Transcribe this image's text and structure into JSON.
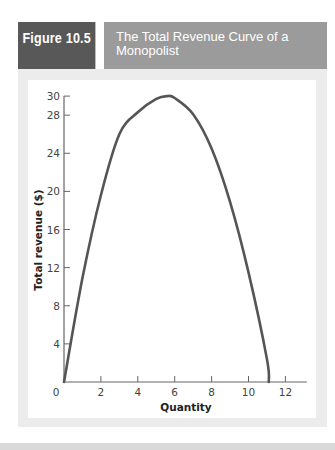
{
  "header": {
    "figure_label": "Figure 10.5",
    "title_line1": "The Total Revenue Curve of a",
    "title_line2": "Monopolist",
    "colors": {
      "label_bg": "#585858",
      "title_bg": "#9b9b9b",
      "text": "#ffffff"
    }
  },
  "chart_data": {
    "type": "line",
    "title": "The Total Revenue Curve of a Monopolist",
    "xlabel": "Quantity",
    "ylabel": "Total revenue ($)",
    "xlim": [
      0,
      13
    ],
    "ylim": [
      0,
      30
    ],
    "xticks": [
      0,
      2,
      4,
      6,
      8,
      10,
      12
    ],
    "yticks": [
      4,
      8,
      12,
      16,
      20,
      24,
      28,
      30
    ],
    "grid": false,
    "legend": null,
    "line_color": "#555555",
    "series": [
      {
        "name": "Total revenue",
        "x": [
          0,
          1,
          2,
          3,
          4,
          5,
          5.6,
          6,
          7,
          8,
          9,
          10,
          11,
          11.1
        ],
        "y": [
          0,
          10.9,
          19.6,
          26.0,
          28.3,
          29.7,
          30.0,
          29.8,
          28.1,
          24.5,
          18.9,
          11.5,
          2.4,
          0
        ]
      }
    ]
  }
}
